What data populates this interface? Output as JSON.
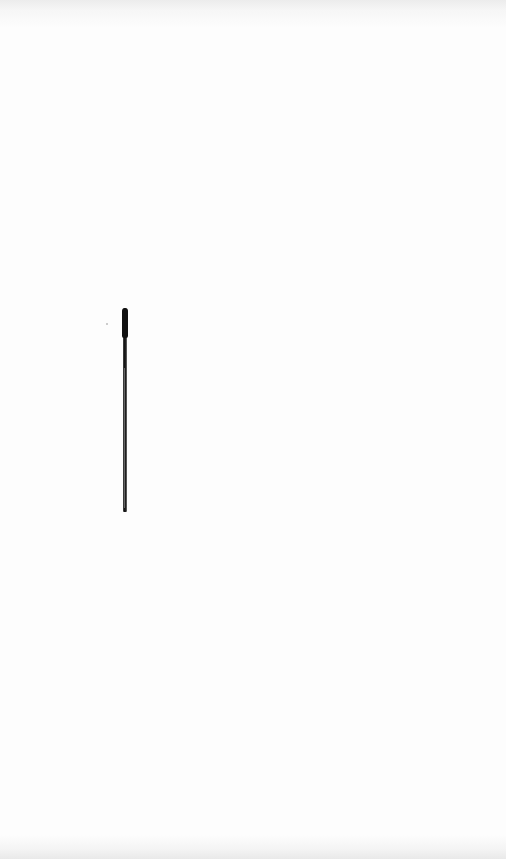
{
  "document": {
    "description": "Overexposed, nearly blank scanned page; printed text is washed out and illegible",
    "faint_text_blocks": [
      {
        "region": "upper-left block, lines near y≈155–260",
        "text": ""
      },
      {
        "region": "lower block near y≈690–710",
        "text": ""
      }
    ],
    "mark": {
      "type": "vertical pen stroke",
      "color": "#111111"
    },
    "colors": {
      "paper": "#fdfdfd",
      "edge_shadow": "#ececec",
      "stroke": "#111111"
    }
  }
}
